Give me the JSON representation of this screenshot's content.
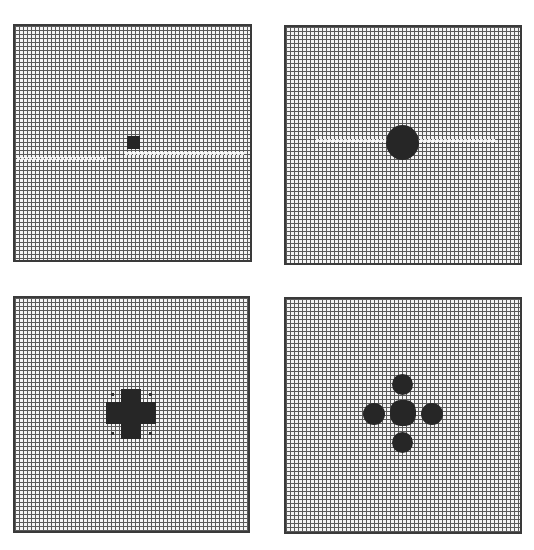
{
  "figure": {
    "panels": [
      {
        "id": 1,
        "description": "grid with single small square at center",
        "shape": "square",
        "pattern_cells": "3x3"
      },
      {
        "id": 2,
        "description": "grid with single round disc at center",
        "shape": "disc",
        "pattern_cells": "~11 diameter"
      },
      {
        "id": 3,
        "description": "grid with plus/cross-shaped cluster at center with faint corner dots",
        "shape": "cross"
      },
      {
        "id": 4,
        "description": "grid with five separated discs in a plus arrangement",
        "shape": "five-discs"
      }
    ],
    "colors": {
      "grid_line": "#5a5a5a",
      "background": "#f4f4f4",
      "pattern": "#262626",
      "border": "#3a3a3a"
    }
  }
}
